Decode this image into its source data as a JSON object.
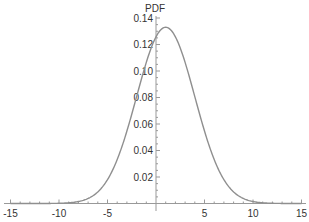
{
  "chart_data": {
    "type": "line",
    "title": "",
    "xlabel": "",
    "ylabel": "PDF",
    "xlim": [
      -15,
      15
    ],
    "ylim": [
      0,
      0.14
    ],
    "x_ticks": [
      "-15",
      "-10",
      "-5",
      "5",
      "10",
      "15"
    ],
    "y_ticks": [
      "0.02",
      "0.04",
      "0.06",
      "0.08",
      "0.10",
      "0.12",
      "0.14"
    ],
    "grid": false,
    "series": [
      {
        "name": "Normal PDF (mean 1, sd 3)",
        "color": "#8f8f8f",
        "x": [
          -10,
          -8,
          -6,
          -4,
          -2,
          0,
          1,
          2,
          4,
          6,
          8,
          10
        ],
        "y": [
          0.0016,
          0.0015,
          0.0089,
          0.0332,
          0.0807,
          0.1258,
          0.133,
          0.1258,
          0.0807,
          0.0332,
          0.0089,
          0.0015
        ]
      }
    ]
  }
}
